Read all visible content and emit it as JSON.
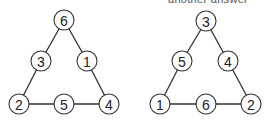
{
  "caption_partial": "another answer",
  "figures": [
    {
      "name": "triangle-left",
      "nodes": [
        {
          "id": "top",
          "label": "6",
          "x": 64,
          "y": 20
        },
        {
          "id": "left-mid",
          "label": "3",
          "x": 41,
          "y": 61
        },
        {
          "id": "right-mid",
          "label": "1",
          "x": 87,
          "y": 61
        },
        {
          "id": "bottom-left",
          "label": "2",
          "x": 19,
          "y": 104
        },
        {
          "id": "bottom-mid",
          "label": "5",
          "x": 64,
          "y": 104
        },
        {
          "id": "bottom-right",
          "label": "4",
          "x": 109,
          "y": 104
        }
      ],
      "sums": {
        "left_side": 11,
        "right_side": 11,
        "bottom_side": 11
      }
    },
    {
      "name": "triangle-right",
      "nodes": [
        {
          "id": "top",
          "label": "3",
          "x": 206,
          "y": 21
        },
        {
          "id": "left-mid",
          "label": "5",
          "x": 182,
          "y": 61
        },
        {
          "id": "right-mid",
          "label": "4",
          "x": 228,
          "y": 61
        },
        {
          "id": "bottom-left",
          "label": "1",
          "x": 160,
          "y": 104
        },
        {
          "id": "bottom-mid",
          "label": "6",
          "x": 206,
          "y": 104
        },
        {
          "id": "bottom-right",
          "label": "2",
          "x": 251,
          "y": 104
        }
      ],
      "sums": {
        "left_side": 9,
        "right_side": 9,
        "bottom_side": 9
      }
    }
  ],
  "style": {
    "stroke": "#333333",
    "fill": "#ffffff",
    "node_radius": 10
  }
}
